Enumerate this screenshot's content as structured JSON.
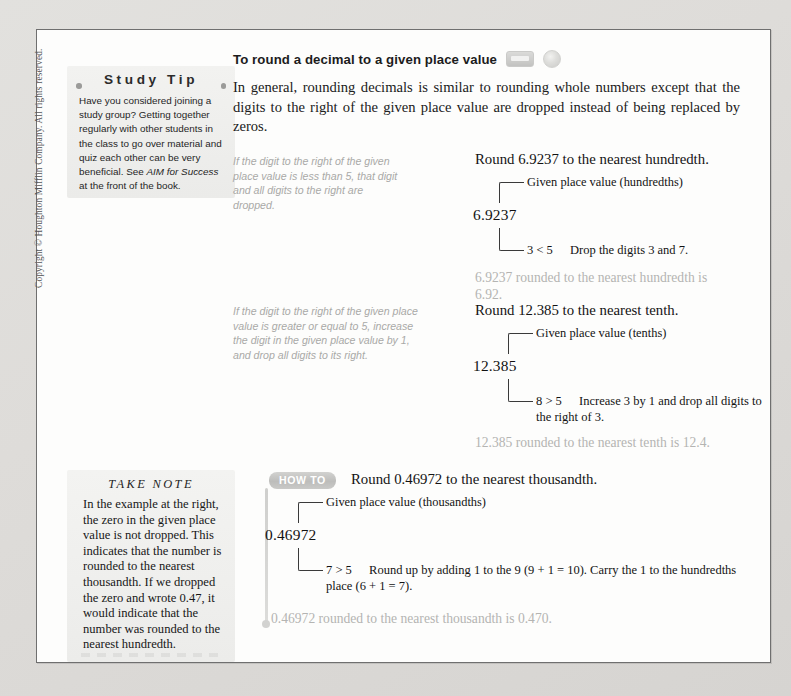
{
  "document": {
    "copyright": "Copyright © Houghton Mifflin Company. All rights reserved.",
    "objective_badge": "Objective B",
    "section_heading": "To round a decimal to a given place value",
    "icons": {
      "media": "video-media-icon",
      "disc": "cd-disc-icon"
    },
    "intro_paragraph": "In general, rounding decimals is similar to rounding whole numbers except that the digits to the right of the given place value are dropped instead of being replaced by zeros."
  },
  "study_tip": {
    "title": "Study Tip",
    "body_part1": "Have you considered joining a study group? Getting together regularly with other students in the class to go over material and quiz each other can be very beneficial. See ",
    "body_italic": "AIM for Success",
    "body_part2": " at the front of the book."
  },
  "take_note": {
    "title": "TAKE NOTE",
    "body": "In the example at the right, the zero in the given place value is not dropped. This indicates that the number is rounded to the nearest thousandth. If we dropped the zero and wrote 0.47, it would indicate that the number was rounded to the nearest hundredth."
  },
  "examples": [
    {
      "rule": "If the digit to the right of the given place value is less than 5, that digit and all digits to the right are dropped.",
      "title": "Round 6.9237 to the nearest hundredth.",
      "place_label": "Given place value (hundredths)",
      "number": "6.9237",
      "comparison": "3 < 5",
      "explanation": "Drop the digits 3 and 7.",
      "result": "6.9237 rounded to the nearest hundredth is 6.92."
    },
    {
      "rule": "If the digit to the right of the given place value is greater or equal to 5, increase the digit in the given place value by 1, and drop all digits to its right.",
      "title": "Round 12.385 to the nearest tenth.",
      "place_label": "Given place value (tenths)",
      "number": "12.385",
      "comparison": "8 > 5",
      "explanation": "Increase 3 by 1 and drop all digits to the right of 3.",
      "result": "12.385 rounded to the nearest tenth is 12.4."
    }
  ],
  "how_to": {
    "badge": "HOW TO",
    "title": "Round 0.46972 to the nearest thousandth.",
    "place_label": "Given place value (thousandths)",
    "number": "0.46972",
    "comparison": "7 > 5",
    "explanation": "Round up by adding 1 to the 9 (9 + 1 = 10). Carry the 1 to the hundredths place (6 + 1 = 7).",
    "result": "0.46972 rounded to the nearest thousandth is 0.470."
  },
  "colors": {
    "page_background": "#d8d8d6",
    "sheet": "#fdfdfc",
    "border": "#6f6f6f",
    "tip_box": "#f2f2f0",
    "gray_text": "#a9a9a7",
    "result_text": "#b4b4b2",
    "badge_gray": "#8e8e8e"
  }
}
